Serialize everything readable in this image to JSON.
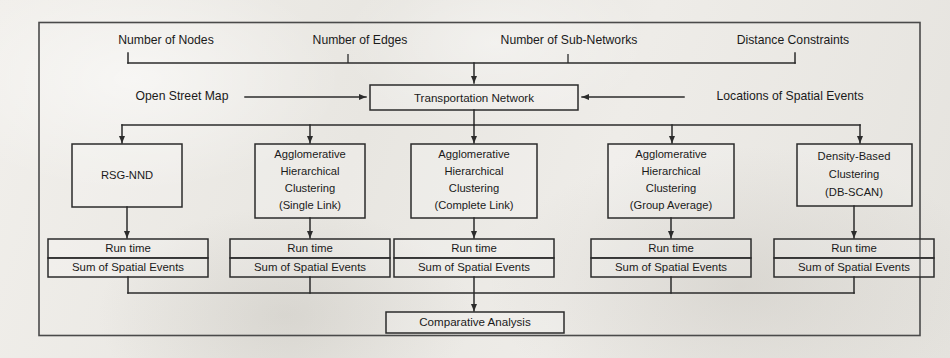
{
  "figure": {
    "type": "flowchart"
  },
  "inputs": {
    "parameters": [
      {
        "label": "Number of Nodes"
      },
      {
        "label": "Number of Edges"
      },
      {
        "label": "Number of Sub-Networks"
      },
      {
        "label": "Distance Constraints"
      }
    ],
    "left_source": "Open Street Map",
    "right_source": "Locations of Spatial Events"
  },
  "network": {
    "label": "Transportation Network"
  },
  "methods": [
    {
      "id": "rsg-nnd",
      "lines": [
        "RSG-NND"
      ]
    },
    {
      "id": "ahc-single",
      "lines": [
        "Agglomerative",
        "Hierarchical",
        "Clustering",
        "(Single Link)"
      ]
    },
    {
      "id": "ahc-complete",
      "lines": [
        "Agglomerative",
        "Hierarchical",
        "Clustering",
        "(Complete Link)"
      ]
    },
    {
      "id": "ahc-group",
      "lines": [
        "Agglomerative",
        "Hierarchical",
        "Clustering",
        "(Group Average)"
      ]
    },
    {
      "id": "dbscan",
      "lines": [
        "Density-Based",
        "Clustering",
        "(DB-SCAN)"
      ]
    }
  ],
  "metrics": {
    "top_label": "Run time",
    "bottom_label": "Sum of Spatial Events"
  },
  "output": {
    "label": "Comparative Analysis"
  },
  "colors": {
    "ink": "#1a1a1a",
    "stroke": "#2b2b2b",
    "frame": "#4a4a4a",
    "paper": "#eceae6"
  }
}
